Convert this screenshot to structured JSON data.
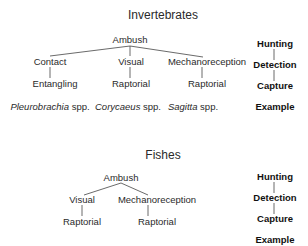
{
  "invertebrates": {
    "title": "Invertebrates",
    "hunting": "Ambush",
    "detection": [
      "Contact",
      "Visual",
      "Mechanoreception"
    ],
    "capture": [
      "Entangling",
      "Raptorial",
      "Raptorial"
    ],
    "examples": [
      {
        "genus": "Pleurobrachia",
        "suffix": " spp."
      },
      {
        "genus": "Corycaeus",
        "suffix": " spp."
      },
      {
        "genus": "Sagitta",
        "suffix": " spp."
      }
    ],
    "levels": [
      "Hunting",
      "Detection",
      "Capture",
      "Example"
    ]
  },
  "fishes": {
    "title": "Fishes",
    "hunting": "Ambush",
    "detection": [
      "Visual",
      "Mechanoreception"
    ],
    "capture": [
      "Raptorial",
      "Raptorial"
    ],
    "levels": [
      "Hunting",
      "Detection",
      "Capture",
      "Example"
    ]
  },
  "colors": {
    "text": "#2a2a2a",
    "line": "#444444",
    "level_text": "#111111"
  }
}
